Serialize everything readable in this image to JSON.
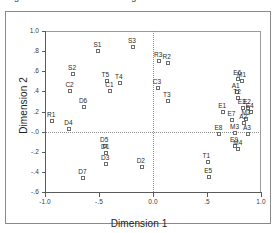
{
  "figure": {
    "caption_clipped": "Figure  Derived Stimulus Configuration  Euclidean distance model",
    "axis_title_x": "Dimension 1",
    "axis_title_y": "Dimension 2"
  },
  "chart_data": {
    "type": "scatter",
    "title": "",
    "xlabel": "Dimension 1",
    "ylabel": "Dimension 2",
    "xlim": [
      -1.0,
      1.0
    ],
    "ylim": [
      -0.6,
      1.0
    ],
    "xticks": [
      -1.0,
      -0.5,
      0.0,
      0.5,
      1.0
    ],
    "xticklabels": [
      "-1.0",
      "-.5",
      "0.0",
      ".5",
      "1.0"
    ],
    "yticks": [
      1.0,
      0.8,
      0.6,
      0.4,
      0.2,
      0.0,
      -0.2,
      -0.4,
      -0.6
    ],
    "yticklabels": [
      "1.0",
      ".8",
      ".6",
      ".4",
      ".2",
      "-.0",
      "-.2",
      "-.4",
      "-.6"
    ],
    "grid": false,
    "reference_lines": {
      "vertical_x": 0.0,
      "horizontal_y": 0.0,
      "style": "dotted"
    },
    "marker": "open-square",
    "legend": "none",
    "points": [
      {
        "label": "S1",
        "x": -0.505,
        "y": 0.8
      },
      {
        "label": "S3",
        "x": -0.185,
        "y": 0.845
      },
      {
        "label": "R3",
        "x": 0.055,
        "y": 0.7
      },
      {
        "label": "R2",
        "x": 0.135,
        "y": 0.68
      },
      {
        "label": "S2",
        "x": -0.74,
        "y": 0.575
      },
      {
        "label": "T5",
        "x": -0.43,
        "y": 0.505
      },
      {
        "label": "T4",
        "x": -0.305,
        "y": 0.48
      },
      {
        "label": "C1",
        "x": -0.395,
        "y": 0.405
      },
      {
        "label": "C2",
        "x": -0.765,
        "y": 0.4
      },
      {
        "label": "C3",
        "x": 0.045,
        "y": 0.435
      },
      {
        "label": "T3",
        "x": 0.14,
        "y": 0.3
      },
      {
        "label": "D6",
        "x": -0.64,
        "y": 0.24
      },
      {
        "label": "R1",
        "x": -0.935,
        "y": 0.105
      },
      {
        "label": "D4",
        "x": -0.775,
        "y": 0.03
      },
      {
        "label": "E6",
        "x": 0.79,
        "y": 0.52
      },
      {
        "label": "M1",
        "x": 0.825,
        "y": 0.505
      },
      {
        "label": "A1",
        "x": 0.775,
        "y": 0.395
      },
      {
        "label": "T2",
        "x": 0.79,
        "y": 0.33
      },
      {
        "label": "E3",
        "x": 0.83,
        "y": 0.235
      },
      {
        "label": "E2",
        "x": 0.88,
        "y": 0.23
      },
      {
        "label": "E4",
        "x": 0.905,
        "y": 0.195
      },
      {
        "label": "E1",
        "x": 0.65,
        "y": 0.2
      },
      {
        "label": "M2",
        "x": 0.865,
        "y": 0.13
      },
      {
        "label": "A2",
        "x": 0.845,
        "y": 0.085
      },
      {
        "label": "E7",
        "x": 0.735,
        "y": 0.12
      },
      {
        "label": "E8",
        "x": 0.615,
        "y": -0.025
      },
      {
        "label": "M3",
        "x": 0.76,
        "y": -0.015
      },
      {
        "label": "A3",
        "x": 0.88,
        "y": -0.02
      },
      {
        "label": "E9",
        "x": 0.76,
        "y": -0.145
      },
      {
        "label": "M4",
        "x": 0.79,
        "y": -0.17
      },
      {
        "label": "D5",
        "x": -0.445,
        "y": -0.145
      },
      {
        "label": "D1",
        "x": -0.435,
        "y": -0.21
      },
      {
        "label": "D3",
        "x": -0.435,
        "y": -0.32
      },
      {
        "label": "D2",
        "x": -0.105,
        "y": -0.355
      },
      {
        "label": "D7",
        "x": -0.645,
        "y": -0.46
      },
      {
        "label": "T1",
        "x": 0.505,
        "y": -0.305
      },
      {
        "label": "E5",
        "x": 0.52,
        "y": -0.45
      }
    ]
  }
}
